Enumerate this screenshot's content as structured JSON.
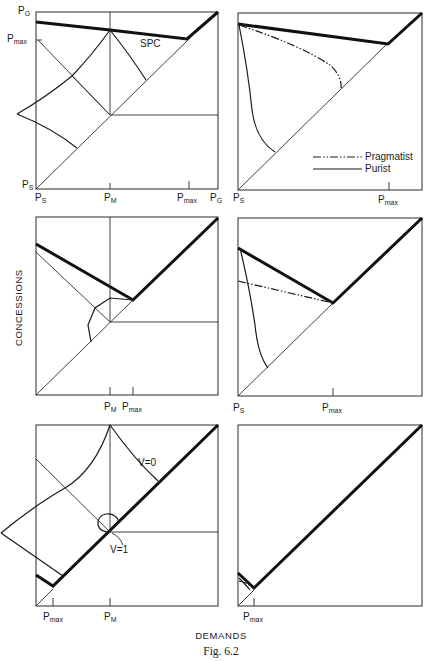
{
  "figure": {
    "caption": "Fig. 6.2",
    "x_axis_title": "DEMANDS",
    "y_axis_title": "CONCESSIONS"
  },
  "panels": {
    "p1": {
      "y_labels": {
        "top": "P",
        "top_sub": "G",
        "pmax": "P",
        "pmax_sub": "max",
        "bottom": "P",
        "bottom_sub": "S"
      },
      "x_labels": {
        "ps": "P",
        "ps_sub": "S",
        "pm": "P",
        "pm_sub": "M",
        "pmax": "P",
        "pmax_sub": "max",
        "pg": "P",
        "pg_sub": "G"
      },
      "annotation": "SPC"
    },
    "p2": {
      "x_labels": {
        "ps": "P",
        "ps_sub": "S",
        "pmax": "P",
        "pmax_sub": "max"
      },
      "legend": [
        {
          "label": "Pragmatist",
          "style": "dash-dot-dot"
        },
        {
          "label": "Purist",
          "style": "solid"
        }
      ]
    },
    "p3": {
      "x_labels": {
        "pm": "P",
        "pm_sub": "M",
        "pmax": "P",
        "pmax_sub": "max"
      }
    },
    "p4": {
      "x_labels": {
        "ps": "P",
        "ps_sub": "S",
        "pmax": "P",
        "pmax_sub": "max"
      }
    },
    "p5": {
      "x_labels": {
        "pmax": "P",
        "pmax_sub": "max",
        "pm": "P",
        "pm_sub": "M"
      },
      "annotations": {
        "v0": "V=0",
        "v1": "V=1"
      }
    },
    "p6": {
      "x_labels": {
        "pmax": "P",
        "pmax_sub": "max"
      }
    }
  }
}
